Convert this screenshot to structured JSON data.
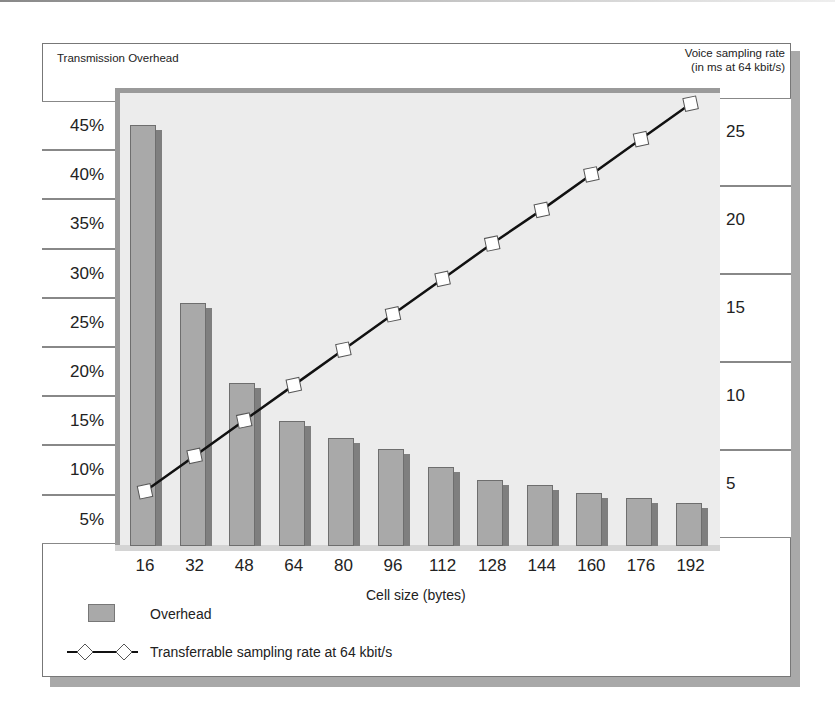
{
  "header": {
    "left_axis_title": "Transmission Overhead",
    "right_axis_title_line1": "Voice sampling rate",
    "right_axis_title_line2": "(in ms at 64 kbit/s)"
  },
  "left_axis": [
    "45%",
    "40%",
    "35%",
    "30%",
    "25%",
    "20%",
    "15%",
    "10%",
    "5%"
  ],
  "right_axis": [
    "25",
    "20",
    "15",
    "10",
    "5"
  ],
  "x_axis": {
    "labels": [
      "16",
      "32",
      "48",
      "64",
      "80",
      "96",
      "112",
      "128",
      "144",
      "160",
      "176",
      "192"
    ],
    "title": "Cell size (bytes)"
  },
  "legend": {
    "bar_label": "Overhead",
    "line_label": "Transferrable sampling rate at 64 kbit/s"
  },
  "colors": {
    "bar": "#a9a9a9",
    "bar_shadow": "#7f7f7f",
    "plot_bg": "#ececec",
    "line": "#111111",
    "marker_fill": "#ffffff"
  },
  "chart_data": {
    "type": "bar",
    "title": "",
    "categories": [
      "16",
      "32",
      "48",
      "64",
      "80",
      "96",
      "112",
      "128",
      "144",
      "160",
      "176",
      "192"
    ],
    "xlabel": "Cell size (bytes)",
    "ylabel": "Transmission Overhead",
    "y2label": "Voice sampling rate (in ms at 64 kbit/s)",
    "ylim": [
      2.5,
      47
    ],
    "y2lim": [
      1.5,
      27.5
    ],
    "series": [
      {
        "name": "Overhead",
        "type": "bar",
        "axis": "left",
        "unit": "%",
        "values": [
          45.0,
          26.9,
          18.8,
          15.0,
          13.2,
          12.1,
          10.3,
          9.0,
          8.5,
          7.6,
          7.1,
          6.6
        ]
      },
      {
        "name": "Transferrable sampling rate at 64 kbit/s",
        "type": "line",
        "axis": "right",
        "unit": "ms",
        "marker": "diamond",
        "values": [
          4.7,
          6.7,
          8.7,
          10.7,
          12.7,
          14.7,
          16.7,
          18.7,
          20.6,
          22.6,
          24.6,
          26.6
        ]
      }
    ],
    "left_ticks": [
      "5%",
      "10%",
      "15%",
      "20%",
      "25%",
      "30%",
      "35%",
      "40%",
      "45%"
    ],
    "right_ticks": [
      "5",
      "10",
      "15",
      "20",
      "25"
    ],
    "grid": false,
    "legend_position": "bottom-left"
  }
}
